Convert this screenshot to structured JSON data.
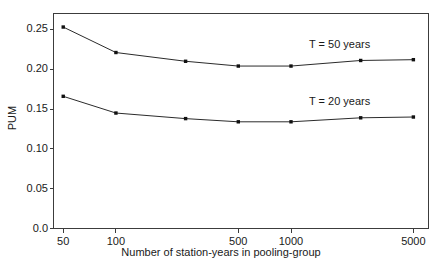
{
  "chart_data": {
    "type": "line",
    "title": "",
    "xlabel": "Number of station-years in pooling-group",
    "ylabel": "PUM",
    "xscale": "log",
    "xlim": [
      44,
      6100
    ],
    "ylim": [
      0.0,
      0.27
    ],
    "grid": false,
    "legend_position": "inline-right",
    "xticks": [
      50,
      100,
      500,
      1000,
      5000
    ],
    "xtick_labels": [
      "50",
      "100",
      "500",
      "1000",
      "5000"
    ],
    "yticks": [
      0.0,
      0.05,
      0.1,
      0.15,
      0.2,
      0.25
    ],
    "ytick_labels": [
      "0.0",
      "0.05",
      "0.10",
      "0.15",
      "0.20",
      "0.25"
    ],
    "x": [
      50,
      100,
      250,
      500,
      1000,
      2500,
      5000
    ],
    "series": [
      {
        "name": "T = 50 years",
        "label": "T = 50 years",
        "color": "#2b2b2b",
        "marker": "filled-square",
        "values": [
          0.253,
          0.221,
          0.21,
          0.204,
          0.204,
          0.211,
          0.212
        ]
      },
      {
        "name": "T = 20 years",
        "label": "T = 20 years",
        "color": "#2b2b2b",
        "marker": "filled-square",
        "values": [
          0.166,
          0.145,
          0.138,
          0.134,
          0.134,
          0.139,
          0.14
        ]
      }
    ],
    "annotations": [
      {
        "text": "T = 50 years",
        "x": 2200,
        "y": 0.232
      },
      {
        "text": "T = 20 years",
        "x": 2200,
        "y": 0.16
      }
    ]
  },
  "figure": {
    "background_color": "#ffffff",
    "axis_color": "#3c3c3c",
    "line_color": "#2b2b2b"
  }
}
